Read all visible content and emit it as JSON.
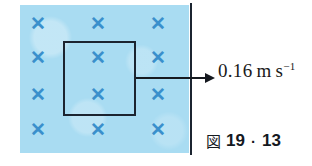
{
  "figure": {
    "title_caption": {
      "symbol": "図",
      "chapter": "19",
      "separator": "·",
      "number": "13"
    },
    "field_region": {
      "description_label": "magnetic-field-into-page-region",
      "fill_color": "#a9dcf2",
      "cross_color": "#3a90cc",
      "cross_glyph": "✕",
      "columns_x": [
        38,
        98,
        158
      ],
      "rows_y": [
        24,
        58,
        95,
        130
      ],
      "crosses": [
        {
          "x": 38,
          "y": 24,
          "glyph": "✕"
        },
        {
          "x": 98,
          "y": 24,
          "glyph": "✕"
        },
        {
          "x": 158,
          "y": 24,
          "glyph": "✕"
        },
        {
          "x": 38,
          "y": 58,
          "glyph": "✕"
        },
        {
          "x": 98,
          "y": 58,
          "glyph": "✕"
        },
        {
          "x": 158,
          "y": 58,
          "glyph": "✕"
        },
        {
          "x": 38,
          "y": 95,
          "glyph": "✕"
        },
        {
          "x": 98,
          "y": 95,
          "glyph": "✕"
        },
        {
          "x": 158,
          "y": 95,
          "glyph": "✕"
        },
        {
          "x": 38,
          "y": 130,
          "glyph": "✕"
        },
        {
          "x": 98,
          "y": 130,
          "glyph": "✕"
        },
        {
          "x": 158,
          "y": 130,
          "glyph": "✕"
        }
      ]
    },
    "coil": {
      "label": "conducting-loop",
      "outline_color": "#1b2430"
    },
    "boundary": {
      "label": "field-boundary",
      "color": "#1b2430"
    },
    "velocity": {
      "arrow_label": "velocity-arrow",
      "value": "0.16",
      "unit_mass": "m",
      "unit_second": "s",
      "unit_exponent": "−1",
      "full_text": "0.16 m s⁻¹",
      "color": "#15191f"
    },
    "page_background": "#ffffff"
  }
}
